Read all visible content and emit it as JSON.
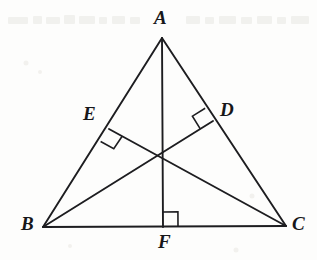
{
  "figure": {
    "width": 317,
    "height": 260,
    "background_color": "#fdfdfc",
    "stroke_color": "#1d1d20",
    "label_color": "#17171a"
  },
  "labels": {
    "A": "A",
    "B": "B",
    "C": "C",
    "D": "D",
    "E": "E",
    "F": "F"
  },
  "label_positions": {
    "A": {
      "x": 154,
      "y": 8
    },
    "B": {
      "x": 21,
      "y": 214
    },
    "C": {
      "x": 292,
      "y": 214
    },
    "D": {
      "x": 220,
      "y": 100
    },
    "E": {
      "x": 83,
      "y": 104
    },
    "F": {
      "x": 158,
      "y": 232
    }
  },
  "points": {
    "A": {
      "x": 162,
      "y": 38
    },
    "B": {
      "x": 43,
      "y": 227
    },
    "C": {
      "x": 286,
      "y": 226
    },
    "D": {
      "x": 213,
      "y": 121
    },
    "E": {
      "x": 109,
      "y": 129
    },
    "F": {
      "x": 163,
      "y": 227
    },
    "H": {
      "x": 163,
      "y": 155
    }
  },
  "segments": [
    {
      "name": "side-AB",
      "from": "A",
      "to": "B"
    },
    {
      "name": "side-AC",
      "from": "A",
      "to": "C"
    },
    {
      "name": "side-BC",
      "from": "B",
      "to": "C"
    },
    {
      "name": "altitude-AF",
      "from": "A",
      "to": "F"
    },
    {
      "name": "altitude-BD",
      "from": "B",
      "to": "D"
    },
    {
      "name": "altitude-CE",
      "from": "C",
      "to": "E"
    }
  ],
  "right_angle_marks": [
    {
      "name": "right-angle-at-F",
      "vertex": "F",
      "size": 15
    },
    {
      "name": "right-angle-at-E",
      "vertex": "E",
      "size": 15
    },
    {
      "name": "right-angle-at-D",
      "vertex": "D",
      "size": 15
    }
  ],
  "scan_artifacts": {
    "description": "faint grey bleed-through smudges along the top edge of the scanned page",
    "smudges": [
      {
        "x": 8,
        "y": 17,
        "w": 20,
        "h": 7
      },
      {
        "x": 33,
        "y": 16,
        "w": 9,
        "h": 8
      },
      {
        "x": 46,
        "y": 17,
        "w": 14,
        "h": 7
      },
      {
        "x": 64,
        "y": 15,
        "w": 11,
        "h": 9
      },
      {
        "x": 79,
        "y": 16,
        "w": 16,
        "h": 8
      },
      {
        "x": 99,
        "y": 17,
        "w": 8,
        "h": 7
      },
      {
        "x": 112,
        "y": 16,
        "w": 13,
        "h": 8
      },
      {
        "x": 130,
        "y": 17,
        "w": 10,
        "h": 7
      },
      {
        "x": 186,
        "y": 16,
        "w": 14,
        "h": 8
      },
      {
        "x": 205,
        "y": 17,
        "w": 9,
        "h": 7
      },
      {
        "x": 219,
        "y": 16,
        "w": 17,
        "h": 8
      },
      {
        "x": 241,
        "y": 17,
        "w": 11,
        "h": 7
      },
      {
        "x": 257,
        "y": 16,
        "w": 15,
        "h": 8
      },
      {
        "x": 277,
        "y": 17,
        "w": 9,
        "h": 7
      },
      {
        "x": 291,
        "y": 16,
        "w": 18,
        "h": 8
      }
    ],
    "specks": [
      {
        "x": 26,
        "y": 63,
        "d": 5
      },
      {
        "x": 40,
        "y": 72,
        "d": 4
      },
      {
        "x": 252,
        "y": 196,
        "d": 5
      },
      {
        "x": 70,
        "y": 246,
        "d": 4
      },
      {
        "x": 236,
        "y": 250,
        "d": 5
      }
    ]
  }
}
